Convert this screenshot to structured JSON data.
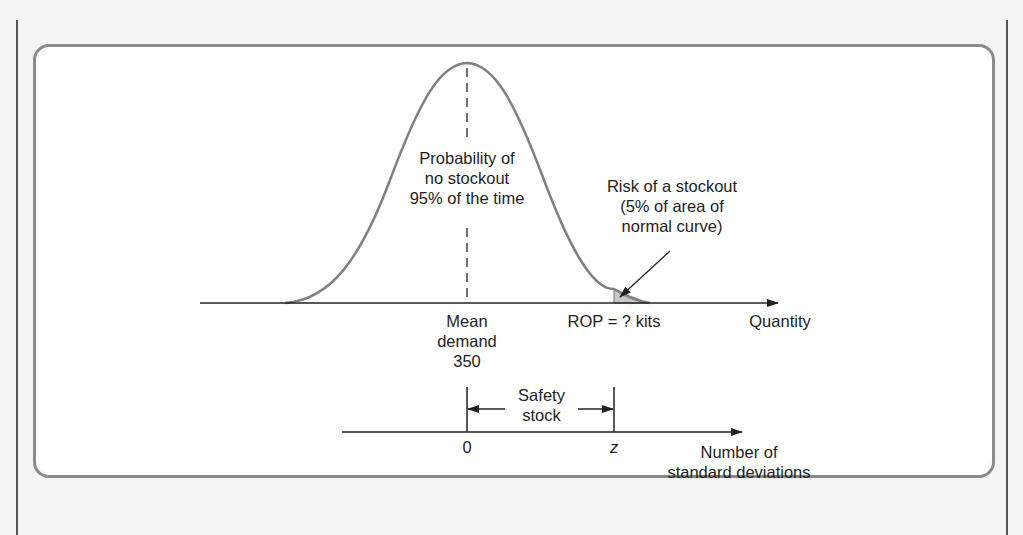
{
  "diagram": {
    "colors": {
      "curve": "#808080",
      "axis": "#222222",
      "box_border": "#8a8a8a",
      "tail_fill": "#c8c8c8",
      "background": "#f4f4f4"
    },
    "labels": {
      "no_stockout": "Probability of\nno stockout\n95% of the time",
      "stockout_risk": "Risk of a stockout\n(5% of area of\nnormal curve)",
      "mean_demand": "Mean\ndemand\n350",
      "rop": "ROP = ? kits",
      "quantity_axis": "Quantity",
      "safety_stock": "Safety\nstock",
      "zero_tick": "0",
      "z_tick": "z",
      "std_axis": "Number of\nstandard deviations"
    },
    "values": {
      "mean_demand": 350,
      "service_level_pct": 95,
      "stockout_risk_pct": 5
    }
  }
}
